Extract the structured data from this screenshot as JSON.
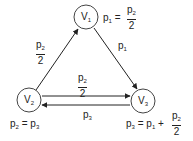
{
  "nodes": [
    {
      "id": "V1",
      "label": "V",
      "sub": "1"
    },
    {
      "id": "V2",
      "label": "V",
      "sub": "2"
    },
    {
      "id": "V3",
      "label": "V",
      "sub": "3"
    }
  ],
  "edges": [
    {
      "from": "V2",
      "to": "V1",
      "label_num": "p",
      "label_num_sub": "2",
      "label_den": "2"
    },
    {
      "from": "V1",
      "to": "V3",
      "label": "p",
      "label_sub": "1"
    },
    {
      "from": "V2",
      "to": "V3",
      "label_num": "p",
      "label_num_sub": "2",
      "label_den": "2"
    },
    {
      "from": "V3",
      "to": "V2",
      "label": "p",
      "label_sub": "3"
    }
  ],
  "equations": {
    "v1": {
      "lhs": "p",
      "lhs_sub": "1",
      "eq": "=",
      "num": "p",
      "num_sub": "2",
      "den": "2"
    },
    "v2": {
      "lhs": "p",
      "lhs_sub": "2",
      "eq": "=",
      "rhs": "p",
      "rhs_sub": "3"
    },
    "v3": {
      "lhs": "p",
      "lhs_sub": "3",
      "eq": "=",
      "rhs": "p",
      "rhs_sub": "1",
      "plus": "+",
      "num": "p",
      "num_sub": "2",
      "den": "2"
    }
  },
  "colors": {
    "stroke": "#222222",
    "background": "#ffffff"
  }
}
